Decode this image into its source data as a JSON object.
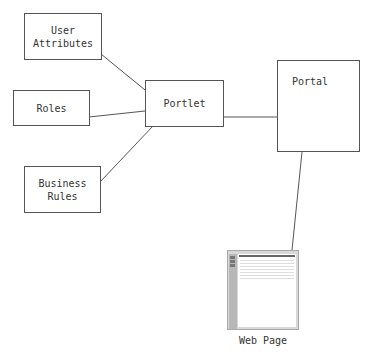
{
  "diagram": {
    "nodes": {
      "user_attributes": {
        "line1": "User",
        "line2": "Attributes"
      },
      "roles": {
        "label": "Roles"
      },
      "business_rules": {
        "line1": "Business",
        "line2": "Rules"
      },
      "portlet": {
        "label": "Portlet"
      },
      "portal": {
        "label": "Portal"
      },
      "web_page": {
        "label": "Web Page",
        "icon": "web-page-icon"
      }
    },
    "edges": [
      {
        "from": "User Attributes",
        "to": "Portlet"
      },
      {
        "from": "Roles",
        "to": "Portlet"
      },
      {
        "from": "Business Rules",
        "to": "Portlet"
      },
      {
        "from": "Portlet",
        "to": "Portal"
      },
      {
        "from": "Portal",
        "to": "Web Page"
      }
    ],
    "colors": {
      "stroke": "#555555",
      "text": "#333333",
      "background": "#ffffff"
    }
  }
}
